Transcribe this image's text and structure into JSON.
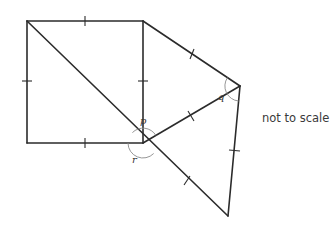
{
  "diagram": {
    "note": "not to scale",
    "angle_labels": {
      "p": "p",
      "q": "q",
      "r": "r"
    },
    "vertices": {
      "square_top_left": [
        27,
        21
      ],
      "square_top_right": [
        143,
        21
      ],
      "square_bottom_right_center": [
        143,
        143
      ],
      "square_bottom_left": [
        27,
        143
      ],
      "right_vertex": [
        240,
        86
      ],
      "bottom_vertex": [
        228,
        216
      ]
    },
    "colors": {
      "line": "#2b2b2b",
      "arc": "#8a8a8a",
      "text": "#3a3a3a"
    }
  }
}
